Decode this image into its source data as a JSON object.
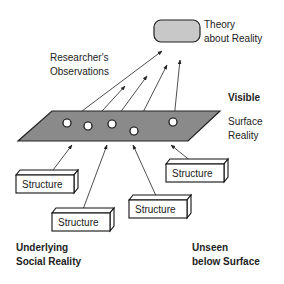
{
  "theory": {
    "line1": "Theory",
    "line2": "about Reality"
  },
  "observations": {
    "line1": "Researcher's",
    "line2": "Observations"
  },
  "visible": "Visible",
  "surface": {
    "line1": "Surface",
    "line2": "Reality"
  },
  "structures": [
    {
      "label": "Structure"
    },
    {
      "label": "Structure"
    },
    {
      "label": "Structure"
    },
    {
      "label": "Structure"
    }
  ],
  "underlying": {
    "line1": "Underlying",
    "line2": "Social Reality"
  },
  "unseen": {
    "line1": "Unseen",
    "line2": "below Surface"
  },
  "colors": {
    "plane": "#8a8a8a",
    "theory_box": "#c8c8c8",
    "stroke": "#222222"
  }
}
